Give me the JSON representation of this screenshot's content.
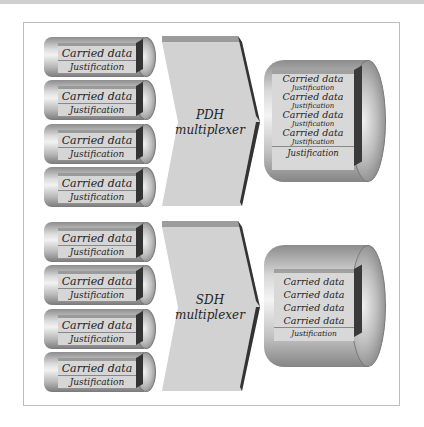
{
  "diagram": {
    "pdh": {
      "inputs": [
        {
          "carried": "Carried data",
          "justification": "Justification"
        },
        {
          "carried": "Carried data",
          "justification": "Justification"
        },
        {
          "carried": "Carried data",
          "justification": "Justification"
        },
        {
          "carried": "Carried data",
          "justification": "Justification"
        }
      ],
      "mux_line1": "PDH",
      "mux_line2": "multiplexer",
      "output": {
        "rows": [
          {
            "carried": "Carried data",
            "justification": "Justification"
          },
          {
            "carried": "Carried data",
            "justification": "Justification"
          },
          {
            "carried": "Carried data",
            "justification": "Justification"
          },
          {
            "carried": "Carried data",
            "justification": "Justification"
          }
        ],
        "footer": "Justification"
      }
    },
    "sdh": {
      "inputs": [
        {
          "carried": "Carried data",
          "justification": "Justification"
        },
        {
          "carried": "Carried data",
          "justification": "Justification"
        },
        {
          "carried": "Carried data",
          "justification": "Justification"
        },
        {
          "carried": "Carried data",
          "justification": "Justification"
        }
      ],
      "mux_line1": "SDH",
      "mux_line2": "multiplexer",
      "output": {
        "rows": [
          "Carried data",
          "Carried data",
          "Carried data",
          "Carried data"
        ],
        "footer": "Justification"
      }
    }
  }
}
